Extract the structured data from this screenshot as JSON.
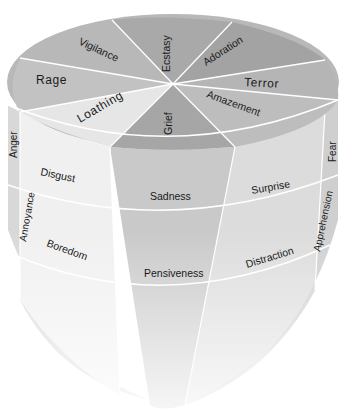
{
  "diagram": {
    "type": "3d-emotion-cone",
    "top_wedges": [
      {
        "label": "Ecstasy",
        "color": "#a9a9a9"
      },
      {
        "label": "Adoration",
        "color": "#a3a3a3"
      },
      {
        "label": "Terror",
        "color": "#b5b5b5"
      },
      {
        "label": "Amazement",
        "color": "#bdbdbd"
      },
      {
        "label": "Grief",
        "color": "#a6a6a6"
      },
      {
        "label": "Loathing",
        "color": "#e6e6e6"
      },
      {
        "label": "Rage",
        "color": "#c2c2c2"
      },
      {
        "label": "Vigilance",
        "color": "#b8b8b8"
      }
    ],
    "side_left": {
      "row1": "Anger",
      "row2": "Annoyance"
    },
    "side_right": {
      "row1": "Fear",
      "row2": "Apprehension"
    },
    "front_columns": [
      {
        "row1": "Disgust",
        "row2": "Boredom",
        "color": "#f0f0f0"
      },
      {
        "row1": "Sadness",
        "row2": "Pensiveness",
        "color": "#c9c9c9"
      },
      {
        "row1": "Surprise",
        "row2": "Distraction",
        "color": "#dcdcdc"
      }
    ],
    "colors": {
      "background": "#ffffff",
      "divider": "#ffffff",
      "text": "#1a1a1a"
    }
  }
}
